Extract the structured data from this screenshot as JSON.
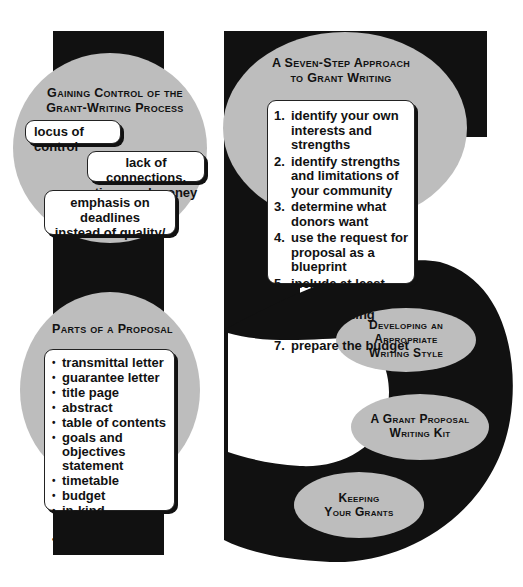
{
  "diagram": {
    "colors": {
      "black": "#111111",
      "gray": "#bfbfbf",
      "white": "#ffffff"
    },
    "shape": "large numeral 5 with vertical bar",
    "sections": {
      "gaining_control": {
        "title_line1": "Gaining Control of the",
        "title_line2": "Grant-Writing Process",
        "items": [
          "locus of control",
          "lack of connections,",
          "time, and money",
          "emphasis on deadlines",
          "instead of quality/",
          "investigator strength"
        ]
      },
      "seven_step": {
        "title_line1": "A Seven-Step Approach",
        "title_line2": "to Grant Writing",
        "steps": [
          {
            "num": "1.",
            "text": "identify your own interests and strengths"
          },
          {
            "num": "2.",
            "text": "identify strengths and limitations of your community"
          },
          {
            "num": "3.",
            "text": "determine what donors want"
          },
          {
            "num": "4.",
            "text": "use the request for proposal as a blueprint"
          },
          {
            "num": "5.",
            "text": "include at least one unique feature"
          },
          {
            "num": "6.",
            "text": "use matching funds"
          },
          {
            "num": "7.",
            "text": "prepare the budget"
          }
        ]
      },
      "parts_of_proposal": {
        "title": "Parts of a Proposal",
        "bullet": "•",
        "items": [
          "transmittal letter",
          "guarantee letter",
          "title page",
          "abstract",
          "table of contents",
          "goals and objectives statement",
          "timetable",
          "budget",
          "in-kind contributions",
          "evaluation"
        ]
      },
      "writing_style": {
        "line1": "Developing an",
        "line2": "Appropriate",
        "line3": "Writing Style"
      },
      "writing_kit": {
        "line1": "A Grant Proposal",
        "line2": "Writing Kit"
      },
      "keeping_grants": {
        "line1": "Keeping",
        "line2": "Your Grants"
      }
    }
  }
}
